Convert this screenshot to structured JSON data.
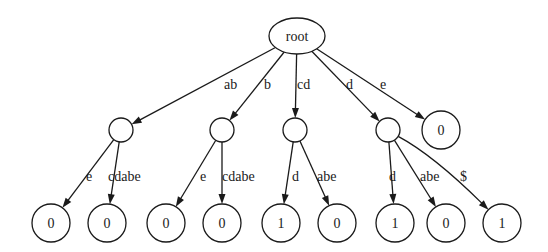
{
  "diagram": {
    "type": "suffix-tree",
    "colors": {
      "stroke": "#1a1a1a",
      "fill": "#ffffff",
      "background": "#ffffff"
    },
    "nodes": [
      {
        "id": "root",
        "label": "root",
        "shape": "ellipse",
        "cx": 297,
        "cy": 36,
        "rx": 28,
        "ry": 18
      },
      {
        "id": "n_ab",
        "label": "",
        "shape": "circle",
        "cx": 121,
        "cy": 130,
        "r": 12
      },
      {
        "id": "n_b",
        "label": "",
        "shape": "circle",
        "cx": 222,
        "cy": 130,
        "r": 12
      },
      {
        "id": "n_cd",
        "label": "",
        "shape": "circle",
        "cx": 295,
        "cy": 130,
        "r": 12
      },
      {
        "id": "n_d",
        "label": "",
        "shape": "circle",
        "cx": 388,
        "cy": 130,
        "r": 12
      },
      {
        "id": "n_e",
        "label": "0",
        "shape": "circle",
        "cx": 441,
        "cy": 130,
        "r": 19
      },
      {
        "id": "l1",
        "label": "0",
        "shape": "circle",
        "cx": 51,
        "cy": 223,
        "r": 19
      },
      {
        "id": "l2",
        "label": "0",
        "shape": "circle",
        "cx": 107,
        "cy": 223,
        "r": 19
      },
      {
        "id": "l3",
        "label": "0",
        "shape": "circle",
        "cx": 166,
        "cy": 223,
        "r": 19
      },
      {
        "id": "l4",
        "label": "0",
        "shape": "circle",
        "cx": 222,
        "cy": 223,
        "r": 19
      },
      {
        "id": "l5",
        "label": "1",
        "shape": "circle",
        "cx": 281,
        "cy": 223,
        "r": 19
      },
      {
        "id": "l6",
        "label": "0",
        "shape": "circle",
        "cx": 337,
        "cy": 223,
        "r": 19
      },
      {
        "id": "l7",
        "label": "1",
        "shape": "circle",
        "cx": 395,
        "cy": 223,
        "r": 19
      },
      {
        "id": "l8",
        "label": "0",
        "shape": "circle",
        "cx": 446,
        "cy": 223,
        "r": 19
      },
      {
        "id": "l9",
        "label": "1",
        "shape": "circle",
        "cx": 502,
        "cy": 223,
        "r": 19
      }
    ],
    "edges": [
      {
        "from": "root",
        "to": "n_ab",
        "label": "ab",
        "lx": 224,
        "ly": 89
      },
      {
        "from": "root",
        "to": "n_b",
        "label": "b",
        "lx": 264,
        "ly": 89
      },
      {
        "from": "root",
        "to": "n_cd",
        "label": "cd",
        "lx": 297,
        "ly": 89
      },
      {
        "from": "root",
        "to": "n_d",
        "label": "d",
        "lx": 346,
        "ly": 89
      },
      {
        "from": "root",
        "to": "n_e",
        "label": "e",
        "lx": 380,
        "ly": 89
      },
      {
        "from": "n_ab",
        "to": "l1",
        "label": "e",
        "lx": 86,
        "ly": 181
      },
      {
        "from": "n_ab",
        "to": "l2",
        "label": "cdabe",
        "lx": 108,
        "ly": 181
      },
      {
        "from": "n_b",
        "to": "l3",
        "label": "e",
        "lx": 200,
        "ly": 181
      },
      {
        "from": "n_b",
        "to": "l4",
        "label": "cdabe",
        "lx": 222,
        "ly": 181
      },
      {
        "from": "n_cd",
        "to": "l5",
        "label": "d",
        "lx": 292,
        "ly": 181
      },
      {
        "from": "n_cd",
        "to": "l6",
        "label": "abe",
        "lx": 317,
        "ly": 181
      },
      {
        "from": "n_d",
        "to": "l7",
        "label": "d",
        "lx": 389,
        "ly": 181
      },
      {
        "from": "n_d",
        "to": "l8",
        "label": "abe",
        "lx": 420,
        "ly": 181
      },
      {
        "from": "n_d",
        "to": "l9",
        "label": "$",
        "lx": 460,
        "ly": 181,
        "curved": true
      }
    ]
  }
}
